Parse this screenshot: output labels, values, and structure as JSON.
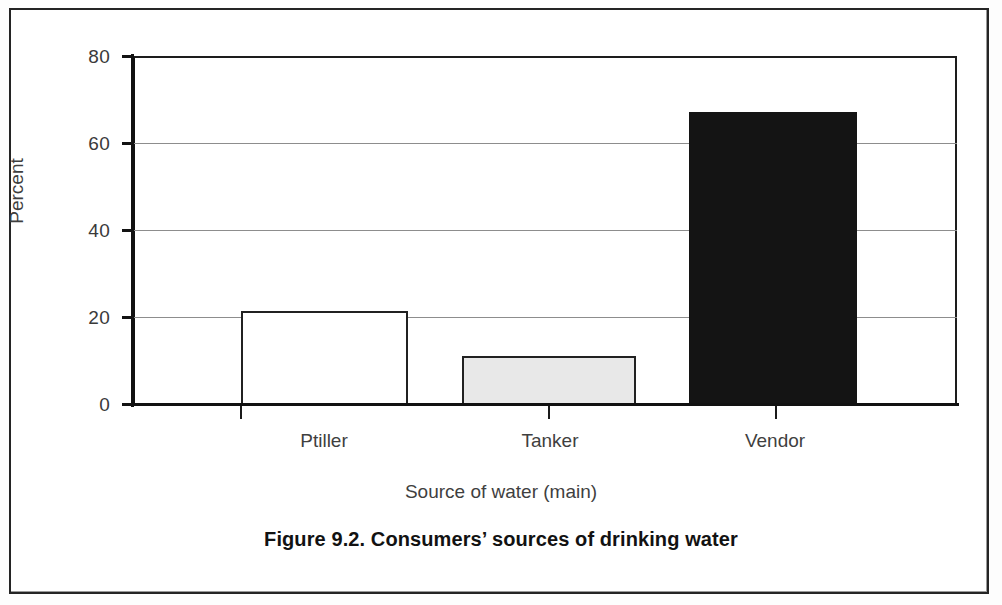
{
  "figure": {
    "caption": "Figure 9.2. Consumers’ sources of drinking water"
  },
  "chart_data": {
    "type": "bar",
    "title": "Figure 9.2. Consumers’ sources of drinking water",
    "xlabel": "Source of water (main)",
    "ylabel": "Percent",
    "categories": [
      "Ptiller",
      "Tanker",
      "Vendor"
    ],
    "values": [
      21.5,
      11.3,
      67.2
    ],
    "series": [
      {
        "name": "Percent",
        "values": [
          21.5,
          11.3,
          67.2
        ]
      }
    ],
    "bar_styles": [
      {
        "category": "Ptiller",
        "fill": "#ffffff",
        "stroke": "#212121",
        "name": "white-bar"
      },
      {
        "category": "Tanker",
        "fill": "#e8e8e8",
        "stroke": "#212121",
        "name": "light-gray-bar"
      },
      {
        "category": "Vendor",
        "fill": "#141414",
        "stroke": "#141414",
        "name": "black-bar"
      }
    ],
    "ylim": [
      0,
      80
    ],
    "yticks": [
      0,
      20,
      40,
      60,
      80
    ],
    "ytick_labels": [
      "0",
      "20",
      "40",
      "60",
      "80"
    ],
    "grid": true,
    "grid_axis": "y",
    "legend": null,
    "legend_position": "none",
    "axis_color": "#111111",
    "grid_color": "#8d8d8d",
    "background": "#ffffff"
  }
}
